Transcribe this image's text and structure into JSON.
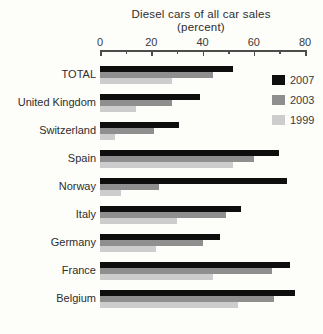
{
  "title": {
    "line1": "Diesel cars of all car sales",
    "line2": "(percent)"
  },
  "legend": {
    "position": "right-top",
    "entries": [
      {
        "label": "2007",
        "color": "#0e0e0e"
      },
      {
        "label": "2003",
        "color": "#8f8f8f"
      },
      {
        "label": "1999",
        "color": "#cdcdcd"
      }
    ]
  },
  "chart_data": {
    "type": "bar",
    "orientation": "horizontal",
    "title": "Diesel cars of all car sales (percent)",
    "xlabel": "percent",
    "ylabel": "",
    "xlim": [
      0,
      80
    ],
    "x_ticks": [
      0,
      20,
      40,
      60,
      80
    ],
    "x_minor_ticks": [
      10,
      30,
      50,
      70
    ],
    "grid": false,
    "axis_position": "top",
    "categories": [
      "TOTAL",
      "United Kingdom",
      "Switzerland",
      "Spain",
      "Norway",
      "Italy",
      "Germany",
      "France",
      "Belgium"
    ],
    "series": [
      {
        "name": "2007",
        "color": "#0e0e0e",
        "values": [
          52,
          39,
          31,
          70,
          73,
          55,
          47,
          74,
          76
        ]
      },
      {
        "name": "2003",
        "color": "#8f8f8f",
        "values": [
          44,
          28,
          21,
          60,
          23,
          49,
          40,
          67,
          68
        ]
      },
      {
        "name": "1999",
        "color": "#cdcdcd",
        "values": [
          28,
          14,
          6,
          52,
          8,
          30,
          22,
          44,
          54
        ]
      }
    ]
  }
}
